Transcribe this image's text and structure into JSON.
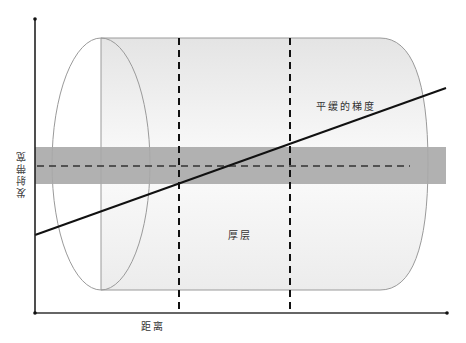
{
  "diagram": {
    "title": "",
    "labels": {
      "gradient_label": "平缓的梯度",
      "thick_layer_label": "厚层",
      "x_axis_label": "距离",
      "y_axis_label": "发射带宽"
    },
    "colors": {
      "axis": "#222222",
      "band": "#a9a9a9",
      "cylinder_outline": "#9a9a9a",
      "cylinder_fill_top": "#e6e6e6",
      "cylinder_fill_bottom": "#f4f4f4",
      "line": "#111111",
      "dashed": "#111111"
    },
    "elements": {
      "y_axis": {
        "x": 35,
        "y1": 19,
        "y2": 313
      },
      "x_axis": {
        "y": 313,
        "x1": 35,
        "x2": 447
      },
      "band": {
        "x": 35,
        "y": 147,
        "width": 411,
        "height": 37
      },
      "band_center_dashed": {
        "y": 166,
        "x1": 35,
        "x2": 410
      },
      "vertical_dashed": [
        {
          "x": 179
        },
        {
          "x": 290
        }
      ],
      "gradient_line": {
        "x1": 35,
        "y1": 235,
        "x2": 446,
        "y2": 88
      },
      "cylinder": {
        "left_cx": 101,
        "cy": 164,
        "rx": 49,
        "ry": 126,
        "right_x": 428
      }
    }
  }
}
